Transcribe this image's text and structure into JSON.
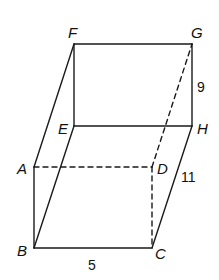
{
  "figure": {
    "type": "prism",
    "colors": {
      "stroke": "#1a1a1a",
      "background": "#ffffff"
    },
    "vertices": {
      "A": {
        "label": "A"
      },
      "B": {
        "label": "B"
      },
      "C": {
        "label": "C"
      },
      "D": {
        "label": "D"
      },
      "E": {
        "label": "E"
      },
      "F": {
        "label": "F"
      },
      "G": {
        "label": "G"
      },
      "H": {
        "label": "H"
      }
    },
    "measurements": {
      "BC": "5",
      "CH": "11",
      "GH": "9"
    },
    "edges": {
      "visible": [
        "FG",
        "GH",
        "EH",
        "FE",
        "FA",
        "AB",
        "BE",
        "BC",
        "CH"
      ],
      "hidden": [
        "AD",
        "DC",
        "DG"
      ]
    }
  }
}
